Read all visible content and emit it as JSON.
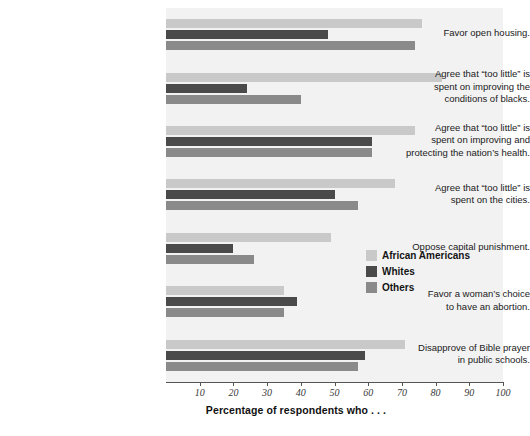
{
  "chart_data": {
    "type": "bar",
    "orientation": "horizontal",
    "title": "",
    "xlabel": "Percentage of respondents who . . .",
    "ylabel": "",
    "xlim": [
      0,
      100
    ],
    "xticks": [
      10,
      20,
      30,
      40,
      50,
      60,
      70,
      80,
      90,
      100
    ],
    "xtick_labels": [
      "10",
      "20",
      "30",
      "40",
      "50",
      "60",
      "70",
      "80",
      "90",
      "100"
    ],
    "grid": true,
    "legend_position": "middle-right-inside",
    "categories": [
      "Favor open housing.",
      "Agree that “too little” is spent on improving the conditions of blacks.",
      "Agree that “too little” is spent on improving and protecting the nation’s health.",
      "Agree that “too little” is spent on the cities.",
      "Oppose capital punishment.",
      "Favor a woman’s choice to have an abortion.",
      "Disapprove of Bible prayer in public schools."
    ],
    "category_lines": [
      [
        "Favor open housing."
      ],
      [
        "Agree that “too little” is",
        "spent on improving the",
        "conditions of blacks."
      ],
      [
        "Agree that “too little” is",
        "spent on improving and",
        "protecting the nation’s health."
      ],
      [
        "Agree that “too little” is",
        "spent on the cities."
      ],
      [
        "Oppose capital punishment."
      ],
      [
        "Favor a woman’s choice",
        "to have an abortion."
      ],
      [
        "Disapprove of Bible prayer",
        "in public schools."
      ]
    ],
    "series": [
      {
        "name": "African Americans",
        "color": "#c9c9c9",
        "values": [
          76,
          82,
          74,
          68,
          49,
          35,
          71
        ]
      },
      {
        "name": "Whites",
        "color": "#4a4a4a",
        "values": [
          48,
          24,
          61,
          50,
          20,
          39,
          59
        ]
      },
      {
        "name": "Others",
        "color": "#8a8a8a",
        "values": [
          74,
          40,
          61,
          57,
          26,
          35,
          57
        ]
      }
    ]
  },
  "legend": {
    "entries": [
      {
        "label": "African Americans",
        "color": "#c9c9c9"
      },
      {
        "label": "Whites",
        "color": "#4a4a4a"
      },
      {
        "label": "Others",
        "color": "#8a8a8a"
      }
    ]
  },
  "axis": {
    "x_title": "Percentage of respondents who . . ."
  }
}
